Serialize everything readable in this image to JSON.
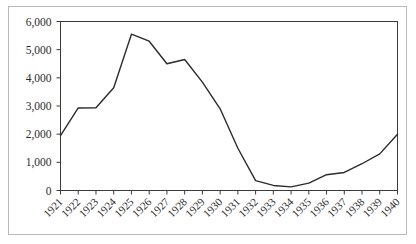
{
  "chart_data": {
    "type": "line",
    "title": "",
    "subtitle": "",
    "xlabel": "",
    "ylabel": "",
    "legend": [],
    "legend_position": "none",
    "grid": false,
    "xlim": [
      1921,
      1940
    ],
    "ylim": [
      0,
      6000
    ],
    "ytick_step": 1000,
    "ytick_labels": [
      "0",
      "1,000",
      "2,000",
      "3,000",
      "4,000",
      "5,000",
      "6,000"
    ],
    "ytick_values": [
      0,
      1000,
      2000,
      3000,
      4000,
      5000,
      6000
    ],
    "categories": [
      "1921",
      "1922",
      "1923",
      "1924",
      "1925",
      "1926",
      "1927",
      "1928",
      "1929",
      "1930",
      "1931",
      "1932",
      "1933",
      "1934",
      "1935",
      "1936",
      "1937",
      "1938",
      "1939",
      "1940"
    ],
    "x": [
      1921,
      1922,
      1923,
      1924,
      1925,
      1926,
      1927,
      1928,
      1929,
      1930,
      1931,
      1932,
      1933,
      1934,
      1935,
      1936,
      1937,
      1938,
      1939,
      1940
    ],
    "values": [
      1950,
      2930,
      2940,
      3650,
      5550,
      5300,
      4500,
      4650,
      3850,
      2900,
      1500,
      350,
      180,
      130,
      260,
      560,
      640,
      950,
      1300,
      2000
    ],
    "series": [
      {
        "name": "series-1",
        "color": "#2b2b2b",
        "values": [
          1950,
          2930,
          2940,
          3650,
          5550,
          5300,
          4500,
          4650,
          3850,
          2900,
          1500,
          350,
          180,
          130,
          260,
          560,
          640,
          950,
          1300,
          2000
        ]
      }
    ],
    "xlabel_rotation": -45,
    "marker": "none",
    "colors": {
      "line": "#2b2b2b",
      "axis": "#3a3a3a",
      "frame": "#b9b9b9",
      "background": "#ffffff",
      "text": "#2b2b2b"
    }
  }
}
